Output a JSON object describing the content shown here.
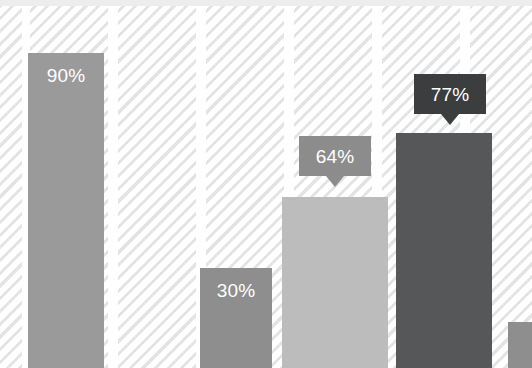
{
  "chart_data": {
    "type": "bar",
    "title": "",
    "subtitle": "",
    "xlabel": "",
    "ylabel": "",
    "ylim": [
      0,
      100
    ],
    "grid": false,
    "legend": null,
    "categories": [
      "",
      "",
      "",
      "",
      ""
    ],
    "values": [
      90,
      30,
      64,
      77,
      null
    ],
    "value_labels": [
      "90%",
      "30%",
      "64%",
      "77%",
      ""
    ],
    "label_styles": [
      "inside",
      "inside",
      "tooltip",
      "tooltip",
      "none"
    ],
    "bar_colors": [
      "#9a9a9a",
      "#8e8e8e",
      "#bcbcbc",
      "#555759",
      "#8e8e8e"
    ],
    "tooltip_colors": [
      "",
      "",
      "#8c8c8c",
      "#3b3d3f",
      ""
    ],
    "background_color": "#ffffff",
    "hatch_color": "#e4e4e4",
    "top_band_color": "#ededed",
    "label_text_color": "#ffffff"
  },
  "bars": [
    {
      "name": "bar-1",
      "label": "90%",
      "x": 28,
      "width": 76,
      "top": 53,
      "color": "#9a9a9a",
      "label_top": 66
    },
    {
      "name": "bar-2",
      "label": "30%",
      "x": 200,
      "width": 72,
      "top": 268,
      "color": "#8e8e8e",
      "label_top": 281
    },
    {
      "name": "bar-3",
      "label": "64%",
      "x": 282,
      "width": 106,
      "top": 197,
      "color": "#bcbcbc",
      "label_top": 0
    },
    {
      "name": "bar-4",
      "label": "77%",
      "x": 396,
      "width": 96,
      "top": 133,
      "color": "#555759",
      "label_top": 0
    },
    {
      "name": "bar-5",
      "label": "",
      "x": 508,
      "width": 24,
      "top": 322,
      "color": "#8e8e8e",
      "label_top": 0
    }
  ],
  "tooltips": [
    {
      "name": "tooltip-64",
      "label": "64%",
      "x": 299,
      "y": 136,
      "width": 72,
      "height": 40,
      "color": "#8c8c8c"
    },
    {
      "name": "tooltip-77",
      "label": "77%",
      "x": 414,
      "y": 74,
      "width": 72,
      "height": 40,
      "color": "#3b3d3f"
    }
  ],
  "hatch_columns": [
    {
      "x": 0,
      "width": 22
    },
    {
      "x": 30,
      "width": 78
    },
    {
      "x": 118,
      "width": 78
    },
    {
      "x": 206,
      "width": 78
    },
    {
      "x": 294,
      "width": 78
    },
    {
      "x": 382,
      "width": 78
    },
    {
      "x": 470,
      "width": 62
    }
  ]
}
